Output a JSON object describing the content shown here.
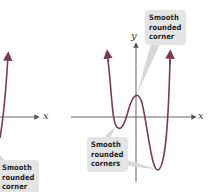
{
  "left_graph": {
    "x_axis_label": "x",
    "callout": {
      "line1": "Smooth",
      "line2": "rounded",
      "line3": "corner"
    }
  },
  "right_graph": {
    "y_axis_label": "y",
    "x_axis_label": "x",
    "callout_top": {
      "line1": "Smooth",
      "line2": "rounded",
      "line3": "corner"
    },
    "callout_bottom": {
      "line1": "Smooth",
      "line2": "rounded",
      "line3": "corners"
    }
  },
  "colors": {
    "curve": "#7a3b5a",
    "axis": "#555555",
    "callout_bg": "#e4e4e4",
    "leader": "#d8d8d8"
  }
}
